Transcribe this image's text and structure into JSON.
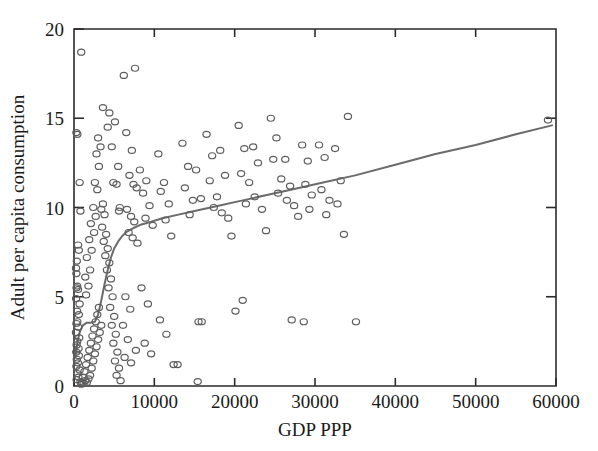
{
  "chart_data": {
    "type": "scatter",
    "title": "",
    "xlabel": "GDP PPP",
    "ylabel": "Adult per capita consumption",
    "xlim": [
      0,
      60000
    ],
    "ylim": [
      0,
      20
    ],
    "grid": false,
    "legend": "none",
    "xticks": [
      0,
      10000,
      20000,
      30000,
      40000,
      50000,
      60000
    ],
    "xtick_labels": [
      "0",
      "10000",
      "20000",
      "30000",
      "40000",
      "50000",
      "60000"
    ],
    "yticks": [
      0,
      5,
      10,
      15,
      20
    ],
    "ytick_labels": [
      "0",
      "5",
      "10",
      "15",
      "20"
    ],
    "marker": "open-circle",
    "marker_color": "#5e5e5e",
    "curve_color": "#6b6b6b",
    "axis_color": "#2b2b2b",
    "series": [
      {
        "name": "Countries",
        "points": [
          [
            900,
            18.7
          ],
          [
            300,
            14.2
          ],
          [
            420,
            14.1
          ],
          [
            700,
            11.4
          ],
          [
            800,
            9.8
          ],
          [
            500,
            7.9
          ],
          [
            600,
            7.6
          ],
          [
            350,
            7.0
          ],
          [
            250,
            6.6
          ],
          [
            300,
            6.3
          ],
          [
            400,
            5.6
          ],
          [
            320,
            5.5
          ],
          [
            500,
            5.4
          ],
          [
            260,
            4.9
          ],
          [
            700,
            4.6
          ],
          [
            380,
            4.2
          ],
          [
            600,
            4.0
          ],
          [
            420,
            3.6
          ],
          [
            300,
            3.5
          ],
          [
            520,
            3.3
          ],
          [
            250,
            3.0
          ],
          [
            650,
            2.7
          ],
          [
            400,
            2.5
          ],
          [
            330,
            2.3
          ],
          [
            560,
            2.1
          ],
          [
            280,
            1.9
          ],
          [
            600,
            1.7
          ],
          [
            350,
            1.5
          ],
          [
            480,
            1.3
          ],
          [
            300,
            1.1
          ],
          [
            700,
            0.9
          ],
          [
            420,
            0.7
          ],
          [
            550,
            0.5
          ],
          [
            330,
            0.35
          ],
          [
            800,
            0.25
          ],
          [
            1000,
            0.2
          ],
          [
            1200,
            0.15
          ],
          [
            900,
            0.1
          ],
          [
            1400,
            0.3
          ],
          [
            1100,
            0.5
          ],
          [
            1600,
            0.2
          ],
          [
            1300,
            0.8
          ],
          [
            1800,
            0.4
          ],
          [
            1500,
            1.2
          ],
          [
            2000,
            0.6
          ],
          [
            1700,
            1.6
          ],
          [
            2200,
            1.0
          ],
          [
            1900,
            2.0
          ],
          [
            2400,
            1.4
          ],
          [
            2100,
            2.4
          ],
          [
            2600,
            1.8
          ],
          [
            2300,
            2.8
          ],
          [
            2800,
            2.2
          ],
          [
            2500,
            3.2
          ],
          [
            3000,
            2.6
          ],
          [
            2700,
            3.6
          ],
          [
            3200,
            3.0
          ],
          [
            2900,
            4.0
          ],
          [
            3400,
            3.4
          ],
          [
            3100,
            4.4
          ],
          [
            1500,
            5.1
          ],
          [
            1800,
            5.6
          ],
          [
            1400,
            6.1
          ],
          [
            2000,
            6.5
          ],
          [
            1600,
            7.2
          ],
          [
            2200,
            7.6
          ],
          [
            1900,
            8.2
          ],
          [
            2500,
            8.6
          ],
          [
            2100,
            9.1
          ],
          [
            2700,
            9.5
          ],
          [
            2400,
            10.0
          ],
          [
            2900,
            11.0
          ],
          [
            2600,
            11.4
          ],
          [
            3100,
            12.3
          ],
          [
            2800,
            13.0
          ],
          [
            3300,
            13.4
          ],
          [
            3000,
            13.9
          ],
          [
            3600,
            10.2
          ],
          [
            3400,
            9.9
          ],
          [
            3800,
            9.6
          ],
          [
            3500,
            8.9
          ],
          [
            4000,
            8.5
          ],
          [
            3700,
            8.1
          ],
          [
            4200,
            7.7
          ],
          [
            3900,
            7.3
          ],
          [
            4400,
            6.9
          ],
          [
            4100,
            6.5
          ],
          [
            4600,
            6.0
          ],
          [
            4300,
            5.5
          ],
          [
            4800,
            5.0
          ],
          [
            4500,
            4.4
          ],
          [
            5000,
            3.9
          ],
          [
            4700,
            3.4
          ],
          [
            5200,
            2.9
          ],
          [
            4900,
            2.4
          ],
          [
            5400,
            1.9
          ],
          [
            5100,
            1.4
          ],
          [
            5600,
            1.0
          ],
          [
            5300,
            0.6
          ],
          [
            5800,
            0.3
          ],
          [
            3600,
            15.6
          ],
          [
            4400,
            15.3
          ],
          [
            4200,
            14.5
          ],
          [
            5100,
            14.8
          ],
          [
            4700,
            13.4
          ],
          [
            5500,
            12.3
          ],
          [
            4900,
            11.4
          ],
          [
            5300,
            11.3
          ],
          [
            5700,
            10.0
          ],
          [
            5600,
            9.8
          ],
          [
            6200,
            17.4
          ],
          [
            7600,
            17.8
          ],
          [
            6500,
            14.2
          ],
          [
            7200,
            13.2
          ],
          [
            6900,
            11.8
          ],
          [
            7400,
            11.3
          ],
          [
            7800,
            11.1
          ],
          [
            6600,
            9.9
          ],
          [
            7100,
            9.5
          ],
          [
            7500,
            9.2
          ],
          [
            6800,
            8.6
          ],
          [
            7300,
            8.3
          ],
          [
            7900,
            8.0
          ],
          [
            6400,
            5.0
          ],
          [
            7000,
            4.3
          ],
          [
            6100,
            3.4
          ],
          [
            6700,
            2.6
          ],
          [
            7700,
            2.0
          ],
          [
            6300,
            1.6
          ],
          [
            7100,
            1.3
          ],
          [
            8200,
            12.1
          ],
          [
            9000,
            11.5
          ],
          [
            8600,
            10.8
          ],
          [
            9400,
            10.1
          ],
          [
            8900,
            9.4
          ],
          [
            9800,
            9.0
          ],
          [
            8400,
            5.5
          ],
          [
            9200,
            4.6
          ],
          [
            8800,
            2.4
          ],
          [
            9600,
            1.8
          ],
          [
            10500,
            13.0
          ],
          [
            11200,
            11.4
          ],
          [
            10800,
            10.9
          ],
          [
            11800,
            10.2
          ],
          [
            11400,
            9.3
          ],
          [
            12100,
            8.4
          ],
          [
            10700,
            3.7
          ],
          [
            11500,
            2.9
          ],
          [
            12400,
            1.2
          ],
          [
            12900,
            1.2
          ],
          [
            13500,
            13.6
          ],
          [
            14200,
            12.3
          ],
          [
            13800,
            11.1
          ],
          [
            14800,
            10.4
          ],
          [
            14400,
            9.6
          ],
          [
            15200,
            12.1
          ],
          [
            15800,
            10.5
          ],
          [
            15500,
            3.6
          ],
          [
            15900,
            3.6
          ],
          [
            15400,
            0.25
          ],
          [
            16500,
            14.1
          ],
          [
            17200,
            12.9
          ],
          [
            16900,
            11.5
          ],
          [
            17800,
            10.6
          ],
          [
            17400,
            10.0
          ],
          [
            18200,
            13.2
          ],
          [
            18800,
            11.8
          ],
          [
            18400,
            9.7
          ],
          [
            19200,
            9.4
          ],
          [
            19600,
            8.4
          ],
          [
            20500,
            14.6
          ],
          [
            21200,
            13.3
          ],
          [
            20800,
            11.9
          ],
          [
            21800,
            11.4
          ],
          [
            21400,
            10.2
          ],
          [
            22300,
            13.4
          ],
          [
            22900,
            12.5
          ],
          [
            22500,
            10.6
          ],
          [
            23400,
            9.9
          ],
          [
            23900,
            8.7
          ],
          [
            24500,
            15.0
          ],
          [
            25200,
            13.9
          ],
          [
            24800,
            12.7
          ],
          [
            25800,
            11.6
          ],
          [
            25400,
            10.8
          ],
          [
            26300,
            12.7
          ],
          [
            26900,
            11.2
          ],
          [
            26500,
            10.4
          ],
          [
            27400,
            10.1
          ],
          [
            27900,
            9.5
          ],
          [
            28400,
            13.5
          ],
          [
            29100,
            12.6
          ],
          [
            28800,
            11.3
          ],
          [
            29600,
            10.7
          ],
          [
            29300,
            9.9
          ],
          [
            30500,
            13.5
          ],
          [
            31200,
            12.8
          ],
          [
            30800,
            11.0
          ],
          [
            31800,
            10.4
          ],
          [
            31400,
            9.6
          ],
          [
            32500,
            13.3
          ],
          [
            33200,
            11.5
          ],
          [
            32800,
            10.2
          ],
          [
            34100,
            15.1
          ],
          [
            33600,
            8.5
          ],
          [
            27100,
            3.7
          ],
          [
            28600,
            3.6
          ],
          [
            35100,
            3.6
          ],
          [
            20100,
            4.2
          ],
          [
            21000,
            4.8
          ],
          [
            59000,
            14.9
          ]
        ]
      }
    ],
    "fit_curve": {
      "name": "lowess-fit",
      "points": [
        [
          150,
          1.6
        ],
        [
          400,
          2.4
        ],
        [
          700,
          3.0
        ],
        [
          1100,
          3.4
        ],
        [
          1600,
          3.55
        ],
        [
          2100,
          3.55
        ],
        [
          2600,
          3.6
        ],
        [
          3000,
          4.0
        ],
        [
          3400,
          4.8
        ],
        [
          3800,
          5.7
        ],
        [
          4200,
          6.5
        ],
        [
          4600,
          7.2
        ],
        [
          5000,
          7.7
        ],
        [
          5500,
          8.1
        ],
        [
          6000,
          8.4
        ],
        [
          6600,
          8.65
        ],
        [
          7400,
          8.85
        ],
        [
          8400,
          9.05
        ],
        [
          9600,
          9.2
        ],
        [
          11000,
          9.4
        ],
        [
          13000,
          9.6
        ],
        [
          15000,
          9.8
        ],
        [
          18000,
          10.1
        ],
        [
          21000,
          10.4
        ],
        [
          24000,
          10.7
        ],
        [
          27000,
          11.0
        ],
        [
          31000,
          11.4
        ],
        [
          35000,
          11.8
        ],
        [
          40000,
          12.4
        ],
        [
          45000,
          13.0
        ],
        [
          50000,
          13.5
        ],
        [
          55000,
          14.1
        ],
        [
          59500,
          14.6
        ]
      ]
    }
  },
  "axes": {
    "x_title": "GDP PPP",
    "y_title": "Adult per capita consumption"
  }
}
